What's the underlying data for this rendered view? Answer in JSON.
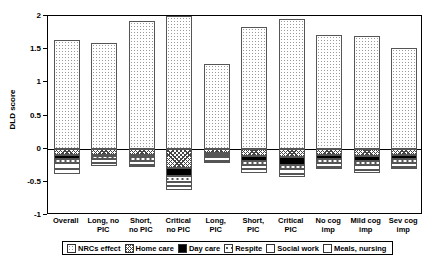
{
  "chart_data": {
    "type": "bar",
    "title": "",
    "xlabel": "",
    "ylabel": "DLD score",
    "ylim": [
      -1,
      2
    ],
    "yticks": [
      2,
      1.5,
      1,
      0.5,
      0,
      -0.5,
      -1
    ],
    "ytick_labels": [
      "2",
      "1.5",
      "1",
      "0.5",
      "0",
      "-0.5",
      "-1"
    ],
    "grid": false,
    "legend_position": "bottom",
    "stacked": true,
    "categories": [
      "Overall",
      "Long, no PIC",
      "Short, no PIC",
      "Critical no PIC",
      "Long, PIC",
      "Short, PIC",
      "Critical PIC",
      "No cog imp",
      "Mild cog imp",
      "Sev cog imp"
    ],
    "category_lines": [
      [
        "Overall",
        ""
      ],
      [
        "Long, no",
        "PIC"
      ],
      [
        "Short,",
        "no PIC"
      ],
      [
        "Critical",
        "no PIC"
      ],
      [
        "Long,",
        "PIC"
      ],
      [
        "Short,",
        "PIC"
      ],
      [
        "Critical",
        "PIC"
      ],
      [
        "No cog",
        "imp"
      ],
      [
        "Mild cog",
        "imp"
      ],
      [
        "Sev cog",
        "imp"
      ]
    ],
    "series": [
      {
        "name": "NRCs effect",
        "pattern": "dotted-grid",
        "values": [
          1.64,
          1.59,
          1.93,
          2.0,
          1.27,
          1.83,
          1.96,
          1.72,
          1.7,
          1.52
        ]
      },
      {
        "name": "Home care",
        "pattern": "cross-hatch",
        "values": [
          -0.1,
          -0.09,
          -0.1,
          -0.29,
          -0.07,
          -0.11,
          -0.13,
          -0.1,
          -0.11,
          -0.1
        ]
      },
      {
        "name": "Day care",
        "pattern": "solid-black",
        "values": [
          -0.06,
          -0.02,
          -0.03,
          -0.12,
          -0.02,
          -0.08,
          -0.11,
          -0.06,
          -0.08,
          -0.06
        ]
      },
      {
        "name": "Respite",
        "pattern": "dashed-white",
        "values": [
          -0.06,
          -0.05,
          -0.05,
          -0.09,
          -0.04,
          -0.05,
          -0.07,
          -0.05,
          -0.06,
          -0.05
        ]
      },
      {
        "name": "Social work",
        "pattern": "white",
        "values": [
          -0.09,
          -0.06,
          -0.06,
          -0.07,
          -0.05,
          -0.07,
          -0.07,
          -0.06,
          -0.07,
          -0.06
        ]
      },
      {
        "name": "Meals, nursing",
        "pattern": "white",
        "values": [
          -0.07,
          -0.04,
          -0.04,
          -0.05,
          -0.03,
          -0.05,
          -0.05,
          -0.04,
          -0.05,
          -0.04
        ]
      }
    ],
    "legend": [
      "NRCs effect",
      "Home care",
      "Day care",
      "Respite",
      "Social work",
      "Meals, nursing"
    ]
  }
}
